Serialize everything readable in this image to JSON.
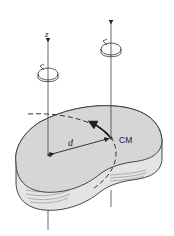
{
  "diagram": {
    "labels": {
      "z_axis": "z",
      "distance": "d",
      "center_of_mass": "CM"
    },
    "colors": {
      "body_fill": "#d6d6d6",
      "body_side": "#e4e4e4",
      "stroke": "#333333",
      "background": "#ffffff"
    },
    "elements": [
      {
        "name": "z-axis",
        "description": "vertical rotation axis through point on body"
      },
      {
        "name": "cm-axis",
        "description": "parallel vertical axis through center of mass"
      },
      {
        "name": "rotation-arrow-z",
        "description": "circular rotation symbol on z axis"
      },
      {
        "name": "rotation-arrow-cm",
        "description": "circular rotation symbol on CM axis"
      },
      {
        "name": "rigid-body",
        "description": "kidney-shaped slab"
      },
      {
        "name": "distance-arrow",
        "description": "double-headed arrow labelled d between axes"
      },
      {
        "name": "dashed-circle",
        "description": "circular path of CM around z axis"
      },
      {
        "name": "motion-arrow",
        "description": "arrow tangent to dashed path at CM"
      }
    ]
  }
}
